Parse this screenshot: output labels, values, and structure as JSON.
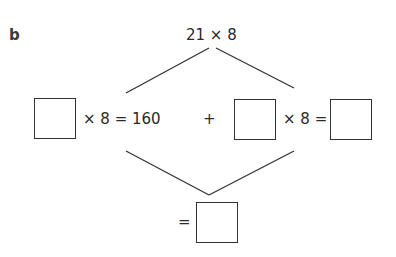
{
  "question": {
    "part_label": "b",
    "top_expression": "21 × 8",
    "left_term": {
      "suffix": "× 8 = 160"
    },
    "operator": "+",
    "right_term": {
      "mid": "× 8 ="
    },
    "result": {
      "prefix": "="
    }
  }
}
